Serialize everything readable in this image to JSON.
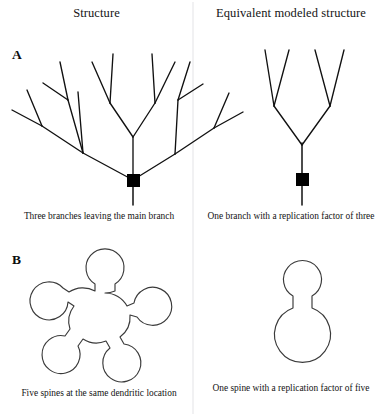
{
  "figure": {
    "background_color": "#ffffff",
    "line_color": "#111111",
    "spine_stroke_color": "#3a3a3a",
    "marker_color": "#000000",
    "divider_color": "#e3e3e6"
  },
  "headers": {
    "left": "Structure",
    "right": "Equivalent modeled structure"
  },
  "panels": [
    {
      "label": "A",
      "left_caption": "Three branches leaving the main branch",
      "right_caption": "One branch with a replication factor of three",
      "left_diagram": {
        "name": "dendritic-tree-full",
        "description": "Branching dendritic tree with three primary branches leaving a marked main branch",
        "branch_count": 3,
        "marker": "black-square"
      },
      "right_diagram": {
        "name": "dendritic-tree-modeled",
        "description": "Single Y branch with two sub-forks representing a replication factor of three",
        "branch_count": 1,
        "replication_factor": 3,
        "marker": "black-square"
      }
    },
    {
      "label": "B",
      "left_caption": "Five spines at the same dendritic location",
      "right_caption": "One spine with a replication factor of five",
      "left_diagram": {
        "name": "spine-cluster-five",
        "description": "Central dendritic location with five spines radiating outward",
        "spine_count": 5
      },
      "right_diagram": {
        "name": "spine-single-modeled",
        "description": "Single spine attached to a dendritic location with a replication factor of five",
        "spine_count": 1,
        "replication_factor": 5
      }
    }
  ]
}
